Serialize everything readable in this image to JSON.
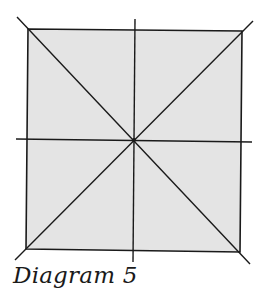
{
  "diagram": {
    "caption": "Diagram 5",
    "fill_color": "#e4e4e4",
    "line_color": "#1a1a1a",
    "square": {
      "corners": {
        "top_left": [
          28,
          29
        ],
        "top_right": [
          242,
          31
        ],
        "bottom_right": [
          240,
          252
        ],
        "bottom_left": [
          26,
          249
        ]
      }
    },
    "center": [
      134,
      140
    ],
    "lines": [
      {
        "name": "diagonal-main",
        "from": [
          17,
          17
        ],
        "to": [
          250,
          264
        ]
      },
      {
        "name": "diagonal-anti",
        "from": [
          15,
          260
        ],
        "to": [
          253,
          21
        ]
      },
      {
        "name": "vertical-axis",
        "from": [
          135,
          19
        ],
        "to": [
          133,
          262
        ]
      },
      {
        "name": "horizontal-axis",
        "from": [
          16,
          139
        ],
        "to": [
          252,
          142
        ]
      }
    ]
  }
}
